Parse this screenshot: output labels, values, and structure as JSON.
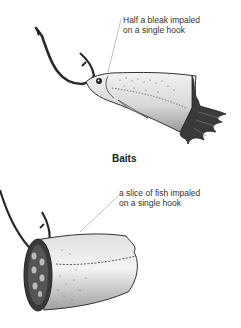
{
  "title": "Baits",
  "callouts": [
    {
      "line1": "Half a bleak impaled",
      "line2": "on a single hook"
    },
    {
      "line1": "a slice of fish impaled",
      "line2": "on a single hook"
    }
  ],
  "illustrations": [
    {
      "name": "half-bleak-on-hook",
      "description": "Front half of a bleak fish with torn ragged end, impaled on a single hook"
    },
    {
      "name": "fish-slice-on-hook",
      "description": "Cylindrical slice of fish impaled on a single hook"
    }
  ],
  "colors": {
    "ink": "#222222",
    "text": "#333333",
    "leader": "#999999",
    "background": "#ffffff"
  }
}
